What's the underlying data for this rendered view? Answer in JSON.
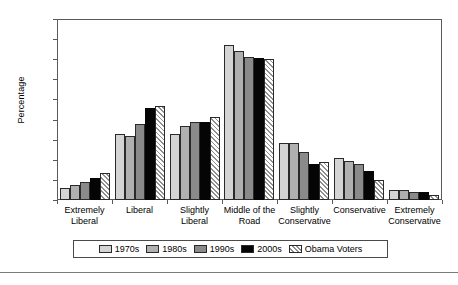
{
  "chart_data": {
    "type": "bar",
    "title": "",
    "xlabel": "",
    "ylabel": "Percentage",
    "ylim": [
      0,
      45
    ],
    "yticks": [
      0,
      5,
      10,
      15,
      20,
      25,
      30,
      35,
      40,
      45
    ],
    "grid": false,
    "legend_position": "bottom",
    "categories": [
      "Extremely Liberal",
      "Liberal",
      "Slightly Liberal",
      "Middle of the Road",
      "Slightly Conservative",
      "Conservative",
      "Extremely Conservative"
    ],
    "category_lines": [
      [
        "Extremely",
        "Liberal"
      ],
      [
        "Liberal",
        ""
      ],
      [
        "Slightly",
        "Liberal"
      ],
      [
        "Middle of the",
        "Road"
      ],
      [
        "Slightly",
        "Conservative"
      ],
      [
        "Conservative",
        ""
      ],
      [
        "Extremely",
        "Conservative"
      ]
    ],
    "series": [
      {
        "name": "1970s",
        "fill": "#d4d4d4",
        "values": [
          3.0,
          16.5,
          16.5,
          38.6,
          14.2,
          10.5,
          2.4
        ]
      },
      {
        "name": "1980s",
        "fill": "#b0b0b0",
        "values": [
          3.7,
          16.0,
          18.3,
          37.0,
          14.2,
          9.7,
          2.5
        ]
      },
      {
        "name": "1990s",
        "fill": "#8a8a8a",
        "values": [
          4.5,
          19.0,
          19.5,
          35.5,
          12.0,
          9.0,
          2.1
        ]
      },
      {
        "name": "2000s",
        "fill": "#050505",
        "values": [
          5.5,
          23.0,
          19.3,
          35.2,
          9.0,
          7.3,
          1.9
        ]
      },
      {
        "name": "Obama Voters",
        "fill": "hatch",
        "values": [
          6.8,
          23.3,
          20.7,
          35.0,
          9.4,
          5.1,
          1.3
        ]
      }
    ]
  }
}
